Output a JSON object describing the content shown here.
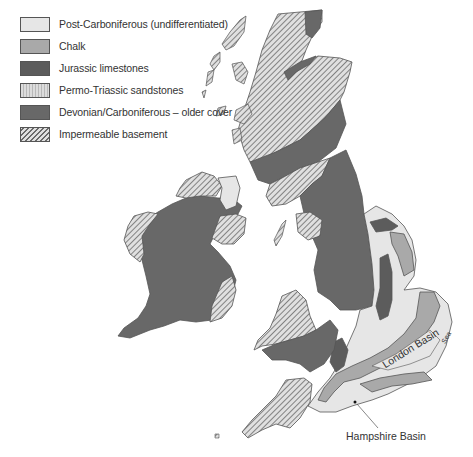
{
  "legend": {
    "items": [
      {
        "label": "Post-Carboniferous (undifferentiated)",
        "key": "post_carboniferous",
        "color": "#e6e6e6",
        "pattern": "solid"
      },
      {
        "label": "Chalk",
        "key": "chalk",
        "color": "#a9a9a9",
        "pattern": "solid"
      },
      {
        "label": "Jurassic limestones",
        "key": "jurassic",
        "color": "#5c5c5c",
        "pattern": "solid"
      },
      {
        "label": "Permo-Triassic sandstones",
        "key": "permo_triassic",
        "color": "#d4d4d4",
        "pattern": "vertical-stripes"
      },
      {
        "label": "Devonian/Carboniferous – older cover",
        "key": "devonian",
        "color": "#686868",
        "pattern": "solid"
      },
      {
        "label": "Impermeable basement",
        "key": "basement",
        "color": "#bdbdbd",
        "pattern": "diagonal-hatch"
      }
    ]
  },
  "map": {
    "labels": {
      "london_basin": "London Basin",
      "sea": "Sea",
      "hampshire_basin": "Hampshire Basin"
    },
    "region": "British Isles geology"
  }
}
